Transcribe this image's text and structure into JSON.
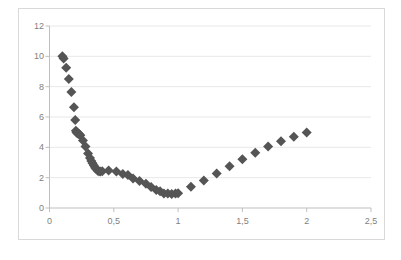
{
  "chart_data": {
    "type": "scatter",
    "title": "",
    "subtitle": "",
    "xlabel": "",
    "ylabel": "",
    "xlim": [
      0,
      2.5
    ],
    "ylim": [
      0,
      12
    ],
    "grid": true,
    "grid_axis": "y",
    "legend": false,
    "legend_position": "none",
    "marker": "diamond",
    "marker_color": "#555555",
    "marker_size": 5,
    "x_tick_labels": [
      "0",
      "0,5",
      "1",
      "1,5",
      "2",
      "2,5"
    ],
    "x_ticks": [
      0,
      0.5,
      1,
      1.5,
      2,
      2.5
    ],
    "y_tick_labels": [
      "0",
      "2",
      "4",
      "6",
      "8",
      "10",
      "12"
    ],
    "y_ticks": [
      0,
      2,
      4,
      6,
      8,
      10,
      12
    ],
    "series": [
      {
        "name": "series-1",
        "points": [
          [
            0.1,
            10.0
          ],
          [
            0.11,
            9.85
          ],
          [
            0.13,
            9.25
          ],
          [
            0.15,
            8.5
          ],
          [
            0.17,
            7.65
          ],
          [
            0.19,
            6.65
          ],
          [
            0.2,
            5.8
          ],
          [
            0.205,
            5.1
          ],
          [
            0.21,
            5.0
          ],
          [
            0.215,
            4.95
          ],
          [
            0.22,
            4.92
          ],
          [
            0.225,
            4.9
          ],
          [
            0.23,
            4.88
          ],
          [
            0.24,
            4.8
          ],
          [
            0.26,
            4.45
          ],
          [
            0.28,
            4.05
          ],
          [
            0.3,
            3.6
          ],
          [
            0.315,
            3.3
          ],
          [
            0.325,
            3.1
          ],
          [
            0.335,
            2.95
          ],
          [
            0.345,
            2.8
          ],
          [
            0.355,
            2.65
          ],
          [
            0.365,
            2.55
          ],
          [
            0.375,
            2.45
          ],
          [
            0.385,
            2.42
          ],
          [
            0.395,
            2.4
          ],
          [
            0.41,
            2.42
          ],
          [
            0.46,
            2.48
          ],
          [
            0.52,
            2.4
          ],
          [
            0.57,
            2.25
          ],
          [
            0.61,
            2.17
          ],
          [
            0.65,
            1.95
          ],
          [
            0.7,
            1.78
          ],
          [
            0.75,
            1.6
          ],
          [
            0.79,
            1.38
          ],
          [
            0.83,
            1.18
          ],
          [
            0.86,
            1.1
          ],
          [
            0.89,
            0.95
          ],
          [
            0.92,
            0.95
          ],
          [
            0.95,
            0.93
          ],
          [
            0.98,
            0.95
          ],
          [
            1.0,
            0.98
          ],
          [
            1.1,
            1.4
          ],
          [
            1.2,
            1.82
          ],
          [
            1.3,
            2.28
          ],
          [
            1.4,
            2.75
          ],
          [
            1.5,
            3.22
          ],
          [
            1.6,
            3.65
          ],
          [
            1.7,
            4.05
          ],
          [
            1.8,
            4.4
          ],
          [
            1.9,
            4.7
          ],
          [
            2.0,
            4.98
          ]
        ]
      }
    ]
  },
  "colors": {
    "marker": "#555555",
    "gridline": "#e8e8e8",
    "axis": "#bfbfbf",
    "border": "#d9d9d9",
    "tick_text": "#7f7f7f"
  }
}
